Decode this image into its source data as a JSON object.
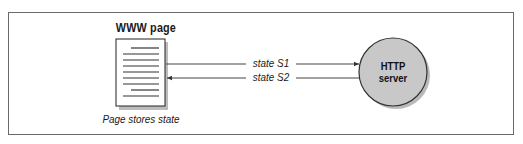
{
  "diagram": {
    "type": "client-server state flow",
    "page_node": {
      "title": "WWW page",
      "caption": "Page stores state",
      "icon": "document-icon"
    },
    "server_node": {
      "label_line1": "HTTP",
      "label_line2": "server",
      "shape": "circle",
      "fill": "#c8c8c8"
    },
    "arrows": [
      {
        "label": "state S1",
        "from": "WWW page",
        "to": "HTTP server"
      },
      {
        "label": "state S2",
        "from": "HTTP server",
        "to": "WWW page"
      }
    ],
    "colors": {
      "line": "#333333",
      "frame": "#6a6a6a",
      "shadow": "#9a9a9a",
      "circle_fill": "#c8c8c8"
    }
  }
}
